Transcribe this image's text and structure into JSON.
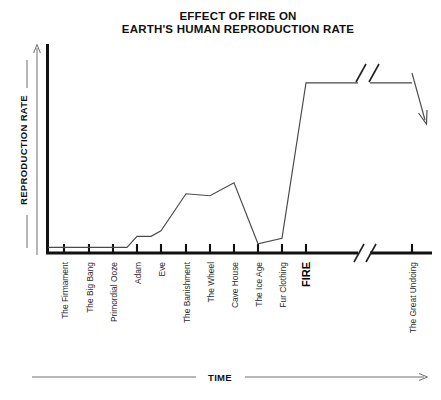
{
  "chart_data": {
    "type": "line",
    "title": "EFFECT OF FIRE ON EARTH'S HUMAN REPRODUCTION RATE",
    "title_lines": [
      "EFFECT OF FIRE ON",
      "EARTH'S HUMAN REPRODUCTION RATE"
    ],
    "xlabel": "TIME",
    "ylabel": "REPRODUCTION RATE",
    "grid": false,
    "legend": null,
    "axis_ticks_labeled": false,
    "ylim": [
      0,
      100
    ],
    "x_break": {
      "present": true,
      "after_category": "FIRE",
      "before_category": "The Great Undoing",
      "symbol": "//"
    },
    "categories": [
      "The Firmament",
      "The Big Bang",
      "Primordial Ooze",
      "Adam",
      "Eve",
      "The Banishment",
      "The Wheel",
      "Cave House",
      "The Ice Age",
      "Fur Clothing",
      "FIRE",
      "The Great Undoing"
    ],
    "emphasized_categories": [
      "FIRE"
    ],
    "values": [
      3,
      3,
      3,
      9,
      12,
      32,
      31,
      38,
      5,
      8,
      92,
      92
    ],
    "series": [
      {
        "name": "Reproduction Rate",
        "values": [
          3,
          3,
          3,
          9,
          12,
          32,
          31,
          38,
          5,
          8,
          92,
          92
        ]
      }
    ],
    "line_end": "down-arrow",
    "line_shape": "stepped then steep rise at FIRE"
  },
  "axes": {
    "y_arrow_label": "REPRODUCTION RATE",
    "x_arrow_label": "TIME"
  },
  "icons": {
    "y_axis_arrow": "arrow-up-icon",
    "x_axis_arrow": "arrow-right-icon",
    "trend_end_arrow": "arrow-down-right-icon",
    "axis_break": "axis-break-icon"
  }
}
